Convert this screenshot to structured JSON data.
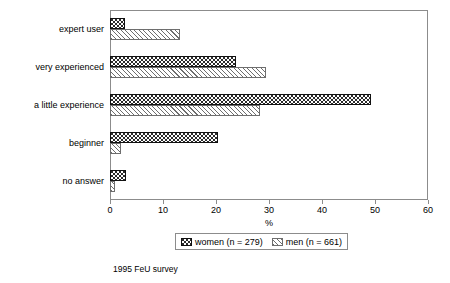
{
  "chart_data": {
    "type": "bar",
    "orientation": "horizontal",
    "title": "",
    "xlabel": "%",
    "ylabel": "",
    "xlim": [
      0,
      60
    ],
    "xticks": [
      0,
      10,
      20,
      30,
      40,
      50,
      60
    ],
    "grid": false,
    "legend_position": "bottom",
    "categories": [
      "no answer",
      "beginner",
      "a little experience",
      "very experienced",
      "expert user"
    ],
    "series": [
      {
        "name": "women (n = 279)",
        "short_name": "women",
        "n": 279,
        "pattern": "checkerboard-dark",
        "color": "#2b2b2b",
        "values": [
          3.0,
          20.3,
          49.3,
          23.8,
          2.8
        ]
      },
      {
        "name": "men (n = 661)",
        "short_name": "men",
        "n": 661,
        "pattern": "diagonal-hatch-light",
        "color": "#ffffff",
        "values": [
          1.0,
          2.0,
          28.3,
          29.5,
          13.2
        ]
      }
    ],
    "caption": "1995 FeU survey"
  },
  "axis": {
    "x_title": "%",
    "tick_labels": [
      "0",
      "10",
      "20",
      "30",
      "40",
      "50",
      "60"
    ]
  },
  "legend": {
    "items": [
      {
        "label": "women (n = 279)"
      },
      {
        "label": "men (n = 661)"
      }
    ]
  },
  "footer": {
    "caption": "1995 FeU survey"
  }
}
